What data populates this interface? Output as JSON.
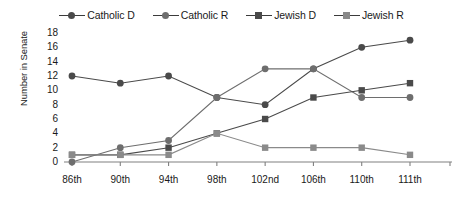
{
  "chart_data": {
    "type": "line",
    "title": "",
    "subtitle": "",
    "xlabel": "",
    "ylabel": "Number in Senate",
    "categories": [
      "86th",
      "90th",
      "94th",
      "98th",
      "102nd",
      "106th",
      "110th",
      "111th"
    ],
    "ylim": [
      0,
      18
    ],
    "ytick_values": [
      0,
      2,
      4,
      6,
      8,
      10,
      12,
      14,
      16,
      18
    ],
    "ytick_labels": [
      "0",
      "2",
      "4",
      "6",
      "8",
      "10",
      "12",
      "14",
      "16",
      "18"
    ],
    "grid": false,
    "legend_position": "top-center",
    "series": [
      {
        "name": "Catholic D",
        "marker": "circle",
        "color": "#4a4a4a",
        "values": [
          12,
          11,
          12,
          9,
          8,
          13,
          16,
          17
        ]
      },
      {
        "name": "Catholic R",
        "marker": "circle",
        "color": "#6e6e6e",
        "values": [
          0,
          2,
          3,
          9,
          13,
          13,
          9,
          9
        ]
      },
      {
        "name": "Jewish D",
        "marker": "square",
        "color": "#4a4a4a",
        "values": [
          1,
          1,
          2,
          4,
          6,
          9,
          10,
          11
        ]
      },
      {
        "name": "Jewish R",
        "marker": "square",
        "color": "#8a8a8a",
        "values": [
          1,
          1,
          1,
          4,
          2,
          2,
          2,
          1
        ]
      }
    ]
  },
  "legend": {
    "items": [
      {
        "label": "Catholic D",
        "marker": "circle"
      },
      {
        "label": "Catholic R",
        "marker": "circle"
      },
      {
        "label": "Jewish D",
        "marker": "square"
      },
      {
        "label": "Jewish R",
        "marker": "square"
      }
    ]
  },
  "axis": {
    "y_title": "Number in Senate",
    "axis_color": "#808080"
  }
}
